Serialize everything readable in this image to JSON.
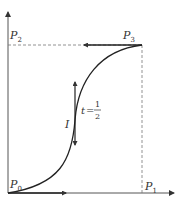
{
  "diagram": {
    "points": [
      {
        "name": "P",
        "sub": "0",
        "x": 8,
        "y": 193
      },
      {
        "name": "P",
        "sub": "1",
        "x": 142,
        "y": 193
      },
      {
        "name": "P",
        "sub": "2",
        "x": 8,
        "y": 45
      },
      {
        "name": "P",
        "sub": "3",
        "x": 142,
        "y": 45
      }
    ],
    "labels": {
      "p0_name": "P",
      "p0_sub": "0",
      "p1_name": "P",
      "p1_sub": "1",
      "p2_name": "P",
      "p2_sub": "2",
      "p3_name": "P",
      "p3_sub": "3",
      "tangent_label": "I",
      "t_label": "t",
      "t_eq": "=",
      "t_num": "1",
      "t_den": "2"
    },
    "colors": {
      "curve": "#333333",
      "axis": "#555555",
      "dashed": "#777777",
      "background": "#ffffff"
    }
  }
}
